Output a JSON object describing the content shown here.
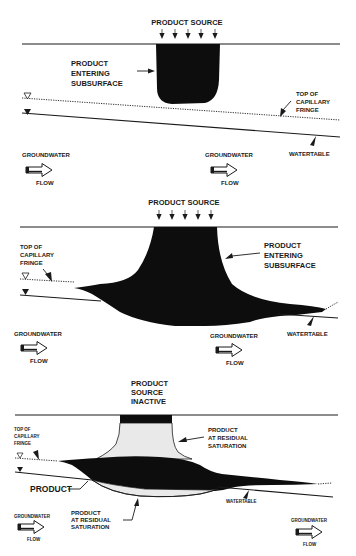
{
  "figure": {
    "background": "#ffffff",
    "ink_color": "#1a1a1a",
    "product_color": "#0d0d0d",
    "residual_color": "#e9e9e9"
  },
  "panels": [
    {
      "id": "stage-1",
      "source_label": "PRODUCT SOURCE",
      "source_arrow_count": 5,
      "product_label": [
        "PRODUCT",
        "ENTERING",
        "SUBSURFACE"
      ],
      "capillary_label": [
        "TOP OF",
        "CAPILLARY",
        "FRINGE"
      ],
      "watertable_label": "WATERTABLE",
      "flow_labels": [
        {
          "top": "GROUNDWATER",
          "bottom": "FLOW"
        },
        {
          "top": "GROUNDWATER",
          "bottom": "FLOW"
        }
      ],
      "symbols": [
        "capillary-fringe-symbol",
        "watertable-symbol"
      ]
    },
    {
      "id": "stage-2",
      "source_label": "PRODUCT SOURCE",
      "source_arrow_count": 5,
      "product_label": [
        "PRODUCT",
        "ENTERING",
        "SUBSURFACE"
      ],
      "capillary_label": [
        "TOP OF",
        "CAPILLARY",
        "FRINGE"
      ],
      "watertable_label": "WATERTABLE",
      "flow_labels": [
        {
          "top": "GROUNDWATER",
          "bottom": "FLOW"
        },
        {
          "top": "GROUNDWATER",
          "bottom": "FLOW"
        }
      ],
      "symbols": [
        "capillary-fringe-symbol",
        "watertable-symbol"
      ]
    },
    {
      "id": "stage-3",
      "source_label": [
        "PRODUCT",
        "SOURCE",
        "INACTIVE"
      ],
      "residual_upper_label": [
        "PRODUCT",
        "AT RESIDUAL",
        "SATURATION"
      ],
      "residual_lower_label": [
        "PRODUCT",
        "AT RESIDUAL",
        "SATURATION"
      ],
      "product_label": "PRODUCT",
      "capillary_label": [
        "TOP OF",
        "CAPILLARY",
        "FRINGE"
      ],
      "watertable_label": "WATERTABLE",
      "flow_labels": [
        {
          "top": "GROUNDWATER",
          "bottom": "FLOW"
        },
        {
          "top": "GROUNDWATER",
          "bottom": "FLOW"
        }
      ],
      "symbols": [
        "capillary-fringe-symbol",
        "watertable-symbol"
      ]
    }
  ]
}
